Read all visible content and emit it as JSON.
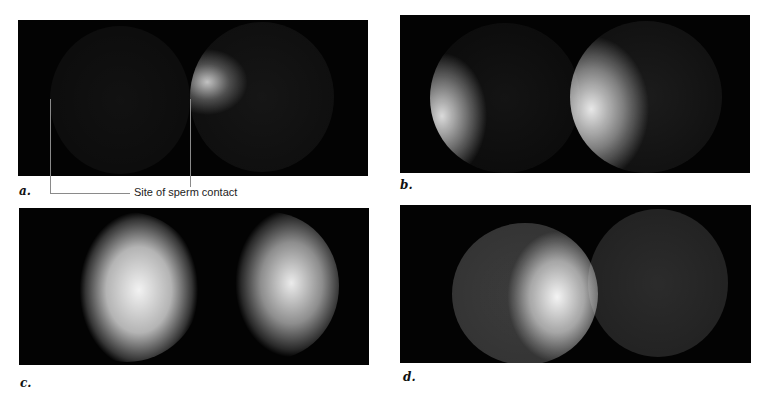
{
  "figure": {
    "panels": [
      {
        "id": "a",
        "label": "a.",
        "description": "Two sea urchin eggs; right egg shows initial bright fluorescence at site of sperm contact"
      },
      {
        "id": "b",
        "label": "b.",
        "description": "Calcium wave spreading from left edge of both eggs"
      },
      {
        "id": "c",
        "label": "c.",
        "description": "Calcium wave covering most of both eggs"
      },
      {
        "id": "d",
        "label": "d.",
        "description": "Calcium wave receding; bright region at right side of left egg"
      }
    ],
    "callout": {
      "text": "Site of sperm contact"
    },
    "colors": {
      "background": "#ffffff",
      "panel_bg": "#030303",
      "fluorescence": "#ffffff",
      "callout_line": "#8a8a8a"
    }
  }
}
